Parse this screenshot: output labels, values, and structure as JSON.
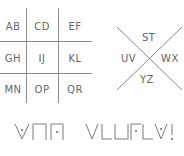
{
  "grid_cipher": {
    "cells": [
      [
        "AB",
        "CD",
        "EF"
      ],
      [
        "GH",
        "IJ",
        "KL"
      ],
      [
        "MN",
        "OP",
        "QR"
      ]
    ]
  },
  "x_cipher": {
    "top": "ST",
    "left": "UV",
    "right": "WX",
    "bottom": "YZ"
  },
  "encoded_message": {
    "glyphs": [
      {
        "shape": "v-dot",
        "letter": "U"
      },
      {
        "shape": "cap",
        "letter": "P"
      },
      {
        "shape": "cap-dot",
        "letter": "P"
      },
      {
        "shape": "space"
      },
      {
        "shape": "v",
        "letter": "S"
      },
      {
        "shape": "corner-bl",
        "letter": "?"
      },
      {
        "shape": "cup",
        "letter": "?"
      },
      {
        "shape": "corner-tl-dot",
        "letter": "?"
      },
      {
        "shape": "corner-bl",
        "letter": "?"
      },
      {
        "shape": "v-dot",
        "letter": "?"
      },
      {
        "shape": "exclaim",
        "letter": "!"
      }
    ],
    "punctuation": "!"
  },
  "colors": {
    "ink": "#8a8a8a",
    "background": "#ffffff"
  }
}
